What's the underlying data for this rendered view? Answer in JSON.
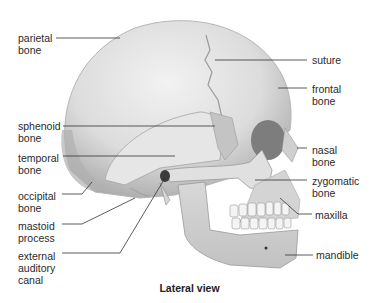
{
  "diagram": {
    "title": "Lateral view",
    "labels_left": [
      {
        "id": "parietal",
        "text": "parietal\nbone"
      },
      {
        "id": "sphenoid",
        "text": "sphenoid\nbone"
      },
      {
        "id": "temporal",
        "text": "temporal\nbone"
      },
      {
        "id": "occipital",
        "text": "occipital\nbone"
      },
      {
        "id": "mastoid",
        "text": "mastoid\nprocess"
      },
      {
        "id": "auditory",
        "text": "external\nauditory\ncanal"
      }
    ],
    "labels_right": [
      {
        "id": "suture",
        "text": "suture"
      },
      {
        "id": "frontal",
        "text": "frontal\nbone"
      },
      {
        "id": "nasal",
        "text": "nasal\nbone"
      },
      {
        "id": "zygomatic",
        "text": "zygomatic\nbone"
      },
      {
        "id": "maxilla",
        "text": "maxilla"
      },
      {
        "id": "mandible",
        "text": "mandible"
      }
    ]
  },
  "colors": {
    "bone_light": "#ececec",
    "bone_mid": "#cfcfcf",
    "bone_shadow": "#9a9a9a",
    "leader_line": "#333333",
    "text": "#2a2a2a"
  }
}
